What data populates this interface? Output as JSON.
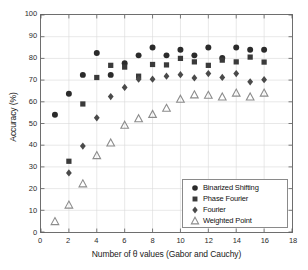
{
  "chart_data": {
    "type": "scatter",
    "title": "",
    "xlabel": "Number of θ values (Gabor and Cauchy)",
    "ylabel": "Accuracy (%)",
    "xlim": [
      0,
      18
    ],
    "ylim": [
      0,
      100
    ],
    "xticks": [
      0,
      2,
      4,
      6,
      8,
      10,
      12,
      14,
      16,
      18
    ],
    "yticks": [
      0,
      10,
      20,
      30,
      40,
      50,
      60,
      70,
      80,
      90,
      100
    ],
    "grid": true,
    "legend_position": "lower right",
    "x": [
      1,
      2,
      3,
      4,
      5,
      6,
      7,
      8,
      9,
      10,
      11,
      12,
      13,
      14,
      15,
      16
    ],
    "series": [
      {
        "name": "Binarized Shifting",
        "marker": "circle",
        "color": "#2b2b2b",
        "values": [
          54.0,
          63.7,
          72.4,
          82.5,
          72.4,
          77.8,
          81.4,
          85.0,
          81.4,
          84.0,
          81.4,
          85.0,
          80.2,
          85.0,
          84.0,
          84.0
        ]
      },
      {
        "name": "Phase Fourier",
        "marker": "square",
        "color": "#3a3a3a",
        "values": [
          null,
          32.6,
          59.0,
          71.2,
          76.8,
          76.0,
          71.8,
          77.2,
          77.0,
          80.0,
          78.4,
          76.8,
          79.2,
          78.4,
          80.6,
          78.3
        ]
      },
      {
        "name": "Fourier",
        "marker": "diamond",
        "color": "#4a4a4a",
        "values": [
          null,
          27.2,
          39.6,
          52.6,
          62.4,
          66.6,
          70.4,
          70.4,
          71.8,
          72.5,
          71.0,
          73.0,
          71.2,
          73.0,
          69.2,
          70.2
        ]
      },
      {
        "name": "Weighted Point",
        "marker": "triangle",
        "color": "#8c8c8c",
        "values": [
          4.8,
          12.4,
          22.2,
          35.2,
          41.0,
          49.2,
          52.2,
          54.2,
          57.0,
          61.2,
          63.2,
          63.0,
          62.2,
          64.0,
          62.2,
          64.0
        ]
      }
    ]
  },
  "legend": {
    "items": [
      {
        "label": "Binarized Shifting",
        "marker": "circle"
      },
      {
        "label": "Phase Fourier",
        "marker": "square"
      },
      {
        "label": "Fourier",
        "marker": "diamond"
      },
      {
        "label": "Weighted Point",
        "marker": "triangle"
      }
    ]
  }
}
